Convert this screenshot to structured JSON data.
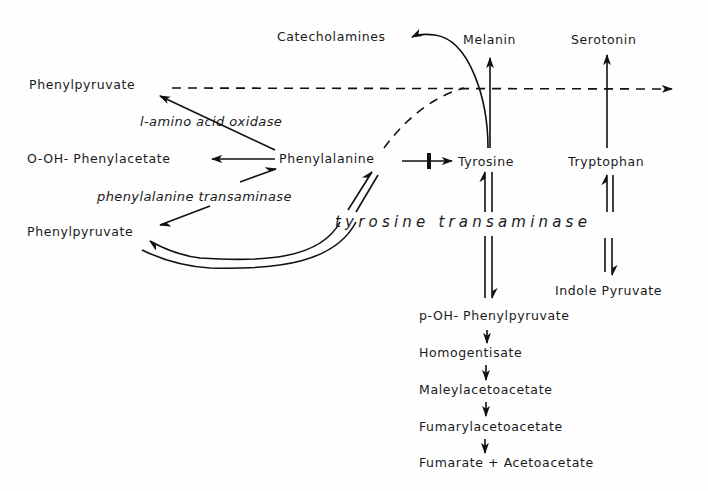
{
  "diagram": {
    "type": "metabolic-pathway",
    "nodes": {
      "catecholamines": "Catecholamines",
      "melanin": "Melanin",
      "serotonin": "Serotonin",
      "phenylpyruvate_top": "Phenylpyruvate",
      "o_oh_phenylacetate": "O-OH- Phenylacetate",
      "phenylalanine": "Phenylalanine",
      "tyrosine": "Tyrosine",
      "tryptophan": "Tryptophan",
      "phenylpyruvate_bottom": "Phenylpyruvate",
      "indole_pyruvate": "Indole Pyruvate",
      "p_oh_phenylpyruvate": "p-OH- Phenylpyruvate",
      "homogentisate": "Homogentisate",
      "maleylacetoacetate": "Maleylacetoacetate",
      "fumarylacetoacetate": "Fumarylacetoacetate",
      "fumarate_acetoacetate": "Fumarate + Acetoacetate"
    },
    "enzymes": {
      "l_amino_acid_oxidase": "l-amino acid oxidase",
      "phenylalanine_transaminase": "phenylalanine transaminase",
      "tyrosine_transaminase": "tyrosine transaminase"
    },
    "edges": [
      {
        "from": "Phenylalanine",
        "to": "Phenylpyruvate (top)",
        "style": "solid",
        "enzyme": "l-amino acid oxidase"
      },
      {
        "from": "Phenylalanine",
        "to": "O-OH- Phenylacetate",
        "style": "solid"
      },
      {
        "from": "Phenylalanine",
        "to": "Phenylpyruvate (bottom)",
        "style": "reversible",
        "enzyme": "phenylalanine transaminase"
      },
      {
        "from": "Phenylalanine",
        "to": "Tyrosine",
        "style": "blocked"
      },
      {
        "from": "Phenylalanine",
        "to": "Phenylpyruvate (bottom)",
        "style": "reversible-curved",
        "enzyme": "tyrosine transaminase"
      },
      {
        "from": "Phenylpyruvate (top)",
        "to": "right",
        "style": "dashed"
      },
      {
        "from": "Phenylalanine",
        "to": "dashed line",
        "style": "dashed-curve"
      },
      {
        "from": "Tyrosine",
        "to": "Catecholamines",
        "style": "solid-curve"
      },
      {
        "from": "Tyrosine",
        "to": "Melanin",
        "style": "solid"
      },
      {
        "from": "Tryptophan",
        "to": "Serotonin",
        "style": "solid"
      },
      {
        "from": "Tyrosine",
        "to": "p-OH- Phenylpyruvate",
        "style": "reversible",
        "enzyme": "tyrosine transaminase"
      },
      {
        "from": "Tryptophan",
        "to": "Indole Pyruvate",
        "style": "reversible",
        "enzyme": "tyrosine transaminase"
      },
      {
        "from": "p-OH- Phenylpyruvate",
        "to": "Homogentisate",
        "style": "solid"
      },
      {
        "from": "Homogentisate",
        "to": "Maleylacetoacetate",
        "style": "solid"
      },
      {
        "from": "Maleylacetoacetate",
        "to": "Fumarylacetoacetate",
        "style": "solid"
      },
      {
        "from": "Fumarylacetoacetate",
        "to": "Fumarate + Acetoacetate",
        "style": "solid"
      }
    ]
  }
}
